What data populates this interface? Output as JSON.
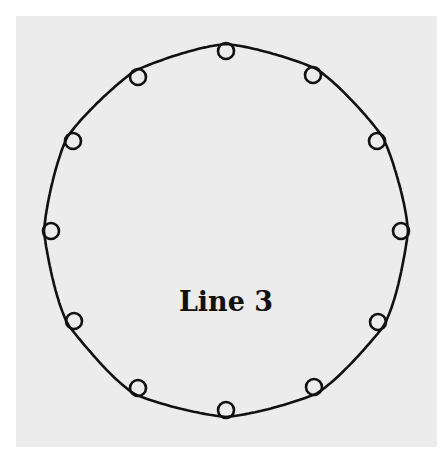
{
  "diagram": {
    "label": "Line 3",
    "colors": {
      "background": "#ffffff",
      "panel": "#ececec",
      "stroke": "#111111"
    },
    "ring": {
      "cx": 226,
      "cy": 228,
      "r": 180
    },
    "loops": [
      {
        "x": 226,
        "y": 51
      },
      {
        "x": 313,
        "y": 75
      },
      {
        "x": 377,
        "y": 141
      },
      {
        "x": 401,
        "y": 231
      },
      {
        "x": 378,
        "y": 322
      },
      {
        "x": 314,
        "y": 387
      },
      {
        "x": 226,
        "y": 410
      },
      {
        "x": 138,
        "y": 388
      },
      {
        "x": 74,
        "y": 321
      },
      {
        "x": 51,
        "y": 231
      },
      {
        "x": 73,
        "y": 141
      },
      {
        "x": 138,
        "y": 77
      }
    ]
  }
}
